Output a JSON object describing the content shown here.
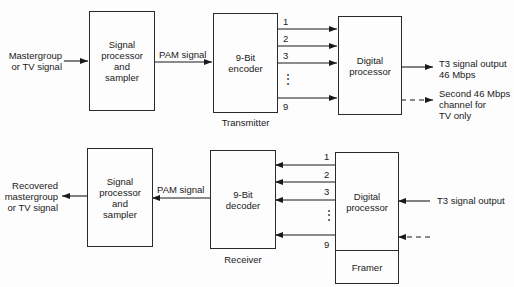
{
  "transmitter": {
    "input_label": "Mastergroup\nor TV signal",
    "sampler_box": "Signal\nprocessor\nand\nsampler",
    "pam_label": "PAM signal",
    "encoder_box": "9-Bit\nencoder",
    "section_label": "Transmitter",
    "channel_labels": [
      "1",
      "2",
      "3",
      "⋮",
      "9"
    ],
    "digital_processor_box": "Digital\nprocessor",
    "output_label": "T3 signal output\n46 Mbps",
    "second_output_label": "Second 46 Mbps\nchannel for\nTV only"
  },
  "receiver": {
    "output_label": "Recovered\nmastergroup\nor TV signal",
    "sampler_box": "Signal\nprocessor\nand\nsampler",
    "pam_label": "PAM signal",
    "decoder_box": "9-Bit\ndecoder",
    "section_label": "Receiver",
    "channel_labels": [
      "1",
      "2",
      "3",
      "⋮",
      "9"
    ],
    "digital_processor_box": "Digital\nprocessor",
    "framer_box": "Framer",
    "input_label": "T3 signal output"
  }
}
